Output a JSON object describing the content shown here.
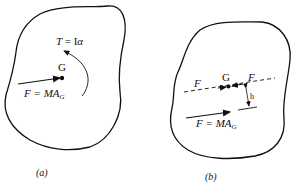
{
  "diagram": {
    "panel_a": {
      "caption": "(a)",
      "torque_label_T": "T",
      "torque_label_rest": "= I",
      "torque_alpha": "α",
      "center_label": "G",
      "force_label_main": "F = MA",
      "force_label_sub": "G"
    },
    "panel_b": {
      "caption": "(b)",
      "force_left_label": "F",
      "center_label": "G",
      "force_right_label": "F",
      "distance_label": "h",
      "force_label_main": "F = MA",
      "force_label_sub": "G"
    }
  }
}
